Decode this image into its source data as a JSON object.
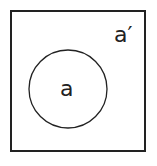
{
  "diagram": {
    "type": "venn",
    "universe": {
      "label": "a′"
    },
    "sets": [
      {
        "label": "a"
      }
    ],
    "colors": {
      "stroke": "#222222",
      "background": "#ffffff"
    }
  }
}
